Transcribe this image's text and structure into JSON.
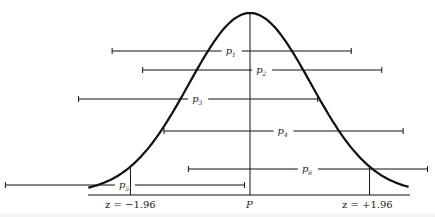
{
  "figure": {
    "center_label": "P",
    "left_cutoff_label": "z = −1.96",
    "right_cutoff_label": "z = +1.96",
    "z_critical": 1.96,
    "intervals": [
      {
        "name": "p",
        "subscript": "1",
        "estimate_z": -0.3,
        "contains_P": true
      },
      {
        "name": "p",
        "subscript": "2",
        "estimate_z": 0.2,
        "contains_P": true
      },
      {
        "name": "p",
        "subscript": "3",
        "estimate_z": -0.85,
        "contains_P": true
      },
      {
        "name": "p",
        "subscript": "4",
        "estimate_z": 0.55,
        "contains_P": true
      },
      {
        "name": "p",
        "subscript": "6",
        "estimate_z": 0.95,
        "contains_P": true
      },
      {
        "name": "p",
        "subscript": "5",
        "estimate_z": -2.05,
        "contains_P": false
      }
    ]
  }
}
